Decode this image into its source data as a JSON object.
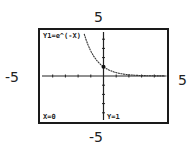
{
  "chart_data": {
    "type": "line",
    "title": "",
    "function": "Y1=e^(-X)",
    "xlim": [
      -5,
      5
    ],
    "ylim": [
      -5,
      5
    ],
    "xlabel": "",
    "ylabel": "",
    "tick_labels": {
      "top": "5",
      "bottom": "-5",
      "left": "-5",
      "right": "5"
    },
    "grid": false,
    "series": [
      {
        "name": "Y1=e^(-X)",
        "x": [
          -1.5,
          -1.25,
          -1.0,
          -0.75,
          -0.5,
          -0.25,
          0,
          0.5,
          1,
          1.5,
          2,
          3,
          4,
          5
        ],
        "values": [
          4.48,
          3.49,
          2.72,
          2.12,
          1.65,
          1.28,
          1.0,
          0.61,
          0.37,
          0.22,
          0.14,
          0.05,
          0.02,
          0.01
        ]
      }
    ],
    "trace_point": {
      "x": 0,
      "y": 1
    }
  },
  "axis_labels": {
    "top": "5",
    "bottom": "-5",
    "left": "-5",
    "right": "5"
  },
  "screen": {
    "equation": "Y1=e^(-X)",
    "x_readout": "X=0",
    "y_readout": "Y=1"
  }
}
